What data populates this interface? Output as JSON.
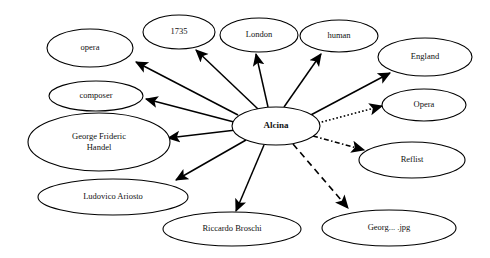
{
  "graph": {
    "type": "node-link-diagram",
    "background_color": "#ffffff",
    "line_color": "#000000",
    "text_color": "#111111",
    "center_node_id": "alcina",
    "nodes": [
      {
        "id": "opera_lc",
        "label": "opera",
        "cx": 90,
        "cy": 48,
        "rx": 43,
        "ry": 19,
        "bold": false,
        "lines": [
          "opera"
        ]
      },
      {
        "id": "y1735",
        "label": "1735",
        "cx": 179,
        "cy": 32,
        "rx": 36,
        "ry": 17,
        "bold": false,
        "lines": [
          "1735"
        ]
      },
      {
        "id": "london",
        "label": "London",
        "cx": 259,
        "cy": 35,
        "rx": 39,
        "ry": 17,
        "bold": false,
        "lines": [
          "London"
        ]
      },
      {
        "id": "human",
        "label": "human",
        "cx": 339,
        "cy": 36,
        "rx": 39,
        "ry": 16,
        "bold": false,
        "lines": [
          "human"
        ]
      },
      {
        "id": "england",
        "label": "England",
        "cx": 425,
        "cy": 57,
        "rx": 47,
        "ry": 19,
        "bold": false,
        "lines": [
          "England"
        ]
      },
      {
        "id": "composer",
        "label": "composer",
        "cx": 96,
        "cy": 96,
        "rx": 47,
        "ry": 15,
        "bold": false,
        "lines": [
          "composer"
        ]
      },
      {
        "id": "opera_uc",
        "label": "Opera",
        "cx": 424,
        "cy": 105,
        "rx": 42,
        "ry": 16,
        "bold": false,
        "lines": [
          "Opera"
        ]
      },
      {
        "id": "alcina",
        "label": "Alcina",
        "cx": 276,
        "cy": 126,
        "rx": 44,
        "ry": 19,
        "bold": true,
        "lines": [
          "Alcina"
        ]
      },
      {
        "id": "handel",
        "label": "George Frideric Handel",
        "cx": 99,
        "cy": 142,
        "rx": 71,
        "ry": 29,
        "bold": false,
        "lines": [
          "George Frideric",
          "Handel"
        ]
      },
      {
        "id": "reflist",
        "label": "Reflist",
        "cx": 412,
        "cy": 160,
        "rx": 53,
        "ry": 18,
        "bold": false,
        "lines": [
          "Reflist"
        ]
      },
      {
        "id": "ariosto",
        "label": "Ludovico Ariosto",
        "cx": 113,
        "cy": 197,
        "rx": 75,
        "ry": 18,
        "bold": false,
        "lines": [
          "Ludovico Ariosto"
        ]
      },
      {
        "id": "broschi",
        "label": "Riccardo Broschi",
        "cx": 232,
        "cy": 229,
        "rx": 69,
        "ry": 17,
        "bold": false,
        "lines": [
          "Riccardo Broschi"
        ]
      },
      {
        "id": "georgjpg",
        "label": "Georg... .jpg",
        "cx": 389,
        "cy": 228,
        "rx": 67,
        "ry": 18,
        "bold": false,
        "lines": [
          "Georg... .jpg"
        ]
      }
    ],
    "edges": [
      {
        "id": "e-alcina-opera_lc",
        "from": "alcina",
        "to": "opera_lc",
        "style": "solid",
        "x1": 238,
        "y1": 115,
        "x2": 136,
        "y2": 62
      },
      {
        "id": "e-alcina-y1735",
        "from": "alcina",
        "to": "y1735",
        "style": "solid",
        "x1": 258,
        "y1": 109,
        "x2": 196,
        "y2": 50
      },
      {
        "id": "e-alcina-london",
        "from": "alcina",
        "to": "london",
        "style": "solid",
        "x1": 268,
        "y1": 107,
        "x2": 256,
        "y2": 54
      },
      {
        "id": "e-alcina-human",
        "from": "alcina",
        "to": "human",
        "style": "solid",
        "x1": 284,
        "y1": 107,
        "x2": 321,
        "y2": 54
      },
      {
        "id": "e-alcina-england",
        "from": "alcina",
        "to": "england",
        "style": "solid",
        "x1": 307,
        "y1": 117,
        "x2": 390,
        "y2": 73
      },
      {
        "id": "e-alcina-composer",
        "from": "alcina",
        "to": "composer",
        "style": "solid",
        "x1": 234,
        "y1": 122,
        "x2": 146,
        "y2": 99
      },
      {
        "id": "e-alcina-handel",
        "from": "alcina",
        "to": "handel",
        "style": "solid",
        "x1": 236,
        "y1": 130,
        "x2": 168,
        "y2": 138
      },
      {
        "id": "e-alcina-ariosto",
        "from": "alcina",
        "to": "ariosto",
        "style": "solid",
        "x1": 246,
        "y1": 140,
        "x2": 176,
        "y2": 180
      },
      {
        "id": "e-alcina-broschi",
        "from": "alcina",
        "to": "broschi",
        "style": "solid",
        "x1": 264,
        "y1": 145,
        "x2": 236,
        "y2": 211
      },
      {
        "id": "e-alcina-opera_uc",
        "from": "alcina",
        "to": "opera_uc",
        "style": "dotted",
        "x1": 318,
        "y1": 123,
        "x2": 382,
        "y2": 106
      },
      {
        "id": "e-alcina-reflist",
        "from": "alcina",
        "to": "reflist",
        "style": "dashdot",
        "x1": 313,
        "y1": 136,
        "x2": 364,
        "y2": 150
      },
      {
        "id": "e-alcina-georgjpg",
        "from": "alcina",
        "to": "georgjpg",
        "style": "dashed",
        "x1": 293,
        "y1": 144,
        "x2": 348,
        "y2": 208
      }
    ]
  }
}
